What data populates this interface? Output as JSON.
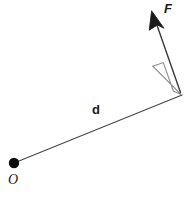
{
  "diagram": {
    "background_color": "#ffffff",
    "stroke_color": "#4a4a4a",
    "ink_color": "#1a1a1a",
    "labels": {
      "force": "F",
      "distance": "d",
      "origin": "O"
    },
    "icons": {
      "pivot": "filled-dot",
      "arrowhead": "filled-triangle",
      "right_angle": "square-marker"
    },
    "geometry": {
      "origin_point": [
        14,
        163
      ],
      "lever_end_point": [
        182,
        95
      ],
      "force_tail_point": [
        180,
        92
      ],
      "force_tip_point": [
        152,
        11
      ],
      "right_angle_size": 30
    }
  }
}
